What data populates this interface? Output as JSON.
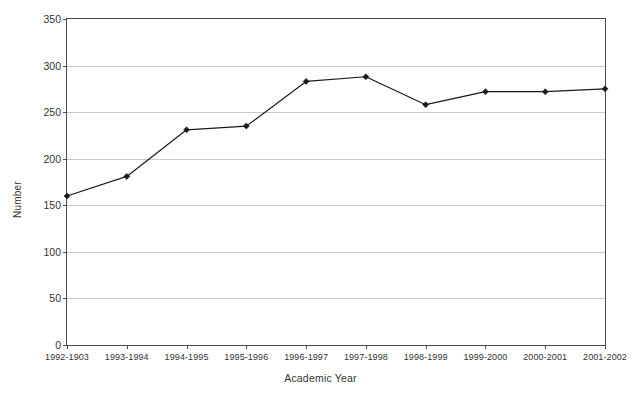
{
  "chart_data": {
    "type": "line",
    "title": "",
    "xlabel": "Academic Year",
    "ylabel": "Number",
    "categories": [
      "1992-1903",
      "1993-1994",
      "1994-1995",
      "1995-1996",
      "1996-1997",
      "1997-1998",
      "1998-1999",
      "1999-2000",
      "2000-2001",
      "2001-2002"
    ],
    "values": [
      160,
      181,
      231,
      235,
      283,
      288,
      258,
      272,
      272,
      275
    ],
    "series": [
      {
        "name": "Number",
        "values": [
          160,
          181,
          231,
          235,
          283,
          288,
          258,
          272,
          272,
          275
        ]
      }
    ],
    "ylim": [
      0,
      350
    ],
    "yticks": [
      0,
      50,
      100,
      150,
      200,
      250,
      300,
      350
    ],
    "ytick_labels": [
      "0",
      "50",
      "100",
      "150",
      "200",
      "250",
      "300",
      "350"
    ],
    "grid": "horizontal",
    "legend": "none",
    "line_color": "#1a1a1a",
    "marker_color": "#1a1a1a",
    "marker": "diamond",
    "gridline_color": "#c9c9c9",
    "axis_color": "#4a4a4a",
    "background_color": "#ffffff"
  }
}
